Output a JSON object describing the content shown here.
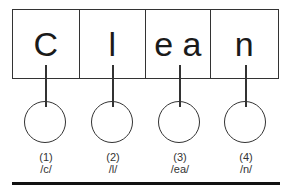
{
  "diagram": {
    "segments": [
      {
        "text": "C",
        "index": "(1)",
        "phoneme": "/c/"
      },
      {
        "text": "l",
        "index": "(2)",
        "phoneme": "/l/"
      },
      {
        "text": "e a",
        "index": "(3)",
        "phoneme": "/ea/"
      },
      {
        "text": "n",
        "index": "(4)",
        "phoneme": "/n/"
      }
    ]
  }
}
